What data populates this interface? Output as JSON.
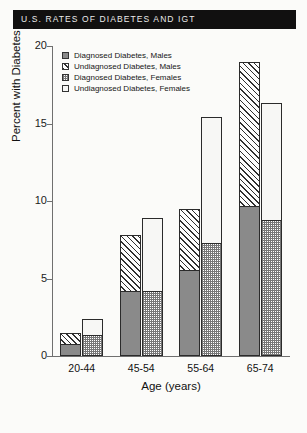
{
  "title": "U.S. RATES OF DIABETES AND IGT",
  "chart_data": {
    "type": "bar",
    "subtype": "stacked-grouped",
    "title": "U.S. RATES OF DIABETES AND IGT",
    "xlabel": "Age (years)",
    "ylabel": "Percent with Diabetes",
    "categories": [
      "20-44",
      "45-54",
      "55-64",
      "65-74"
    ],
    "ylim": [
      0,
      20
    ],
    "yticks": [
      0,
      5,
      10,
      15,
      20
    ],
    "ytick_labels": [
      "0",
      "5",
      "10",
      "15",
      "20"
    ],
    "grid": false,
    "legend_position": "upper-left-inside",
    "series": [
      {
        "name": "Diagnosed Diabetes, Males",
        "swatch": "solid-gray",
        "group": "Males",
        "stack_position": "lower",
        "values": [
          0.7,
          4.1,
          5.5,
          9.6
        ]
      },
      {
        "name": "Undiagnosed Diabetes, Males",
        "swatch": "diagonal-hatch",
        "group": "Males",
        "stack_position": "upper",
        "values": [
          0.8,
          3.7,
          4.0,
          9.4
        ]
      },
      {
        "name": "Diagnosed Diabetes, Females",
        "swatch": "checkered-gray",
        "group": "Females",
        "stack_position": "lower",
        "values": [
          1.3,
          4.1,
          7.2,
          8.7
        ]
      },
      {
        "name": "Undiagnosed Diabetes, Females",
        "swatch": "white",
        "group": "Females",
        "stack_position": "upper",
        "values": [
          1.1,
          4.8,
          8.2,
          7.6
        ]
      }
    ],
    "totals": {
      "males": [
        1.5,
        7.8,
        9.5,
        19.0
      ],
      "females": [
        2.4,
        8.9,
        15.4,
        16.3
      ]
    }
  }
}
